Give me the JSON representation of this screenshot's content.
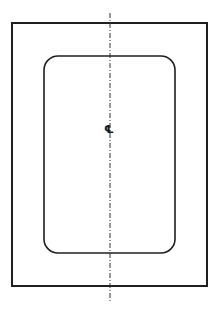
{
  "diagram": {
    "type": "plan-view-drawing",
    "stroke_color": "#1f1f1f",
    "background": "#ffffff",
    "outer_frame": {
      "x": 12,
      "y": 23,
      "width": 195,
      "height": 263,
      "stroke_width": 2
    },
    "inner_panel": {
      "x": 44,
      "y": 56,
      "width": 131,
      "height": 197,
      "corner_radius": 14,
      "stroke_width": 1.6
    },
    "centerline": {
      "x": 110,
      "y_start": 13,
      "y_end": 301,
      "style": "dash-dot"
    },
    "centerline_symbol": {
      "text": "℄",
      "x": 105,
      "y": 124
    }
  }
}
